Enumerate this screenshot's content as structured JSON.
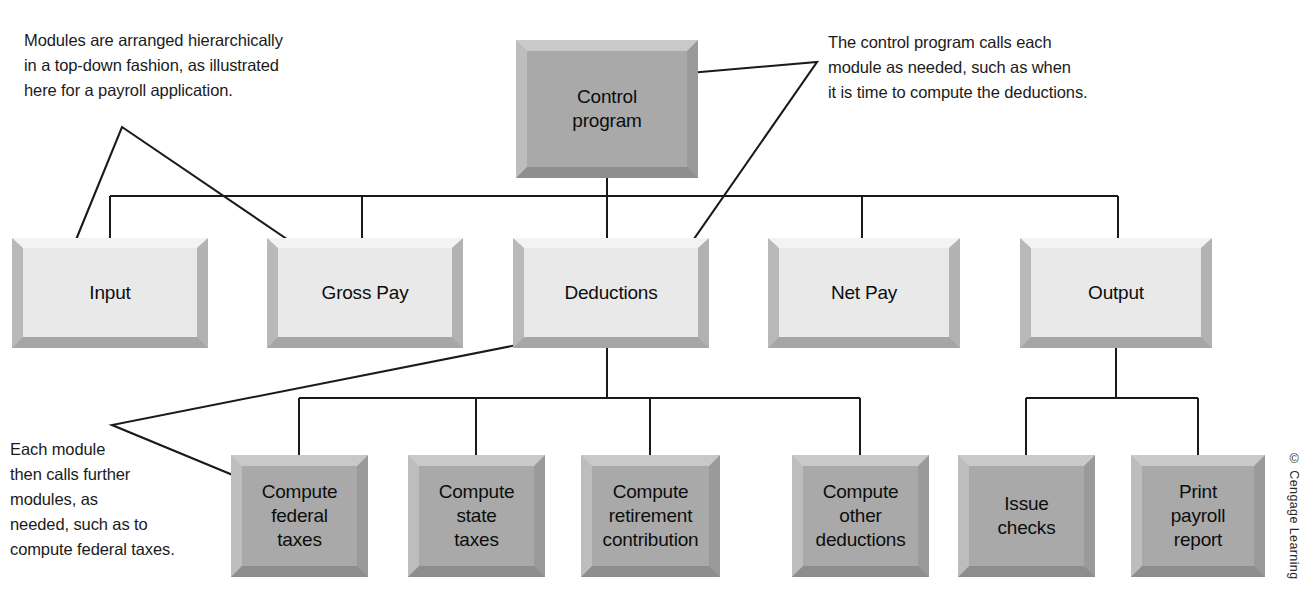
{
  "figure": {
    "kind": "hierarchy-diagram",
    "credit": "© Cengage Learning"
  },
  "annotations": [
    {
      "id": "top-left",
      "text": "Modules are arranged hierarchically\nin a top-down fashion, as illustrated\nhere for a payroll application.",
      "points_to": [
        "Input",
        "Gross Pay"
      ]
    },
    {
      "id": "top-right",
      "text": "The control program calls each\nmodule as needed, such as when\nit is time to compute the deductions.",
      "points_to": [
        "Control program",
        "Deductions"
      ]
    },
    {
      "id": "bottom-left",
      "text": "Each module\nthen calls further\nmodules, as\nneeded, such as to\ncompute federal taxes.",
      "points_to": [
        "Deductions",
        "Compute federal taxes"
      ]
    }
  ],
  "nodes": {
    "root": {
      "label": "Control\nprogram",
      "style": "dark"
    },
    "level2": [
      {
        "label": "Input",
        "style": "light"
      },
      {
        "label": "Gross Pay",
        "style": "light"
      },
      {
        "label": "Deductions",
        "style": "light"
      },
      {
        "label": "Net Pay",
        "style": "light"
      },
      {
        "label": "Output",
        "style": "light"
      }
    ],
    "deductions_children": [
      {
        "label": "Compute\nfederal\ntaxes",
        "style": "dark"
      },
      {
        "label": "Compute\nstate\ntaxes",
        "style": "dark"
      },
      {
        "label": "Compute\nretirement\ncontribution",
        "style": "dark"
      },
      {
        "label": "Compute\nother\ndeductions",
        "style": "dark"
      }
    ],
    "output_children": [
      {
        "label": "Issue\nchecks",
        "style": "dark"
      },
      {
        "label": "Print\npayroll\nreport",
        "style": "dark"
      }
    ]
  },
  "colors": {
    "background": "#ffffff",
    "box_dark_fill": "#a9a9a9",
    "box_light_fill": "#e9e9e9",
    "connector": "#1a1a1a",
    "text": "#0d0d0d"
  }
}
